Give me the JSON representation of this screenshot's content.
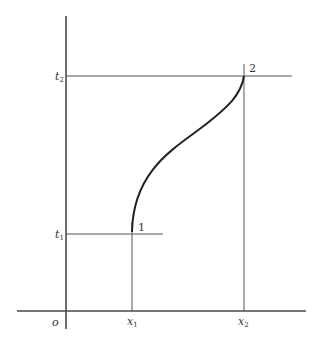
{
  "diagram": {
    "type": "worldline-spacetime-diagram",
    "colors": {
      "axis": "#4a4a4a",
      "guide": "#555555",
      "curve": "#222222",
      "text": "#333333"
    },
    "labels": {
      "origin": "o",
      "t1": "t",
      "t1_sub": "1",
      "t2": "t",
      "t2_sub": "2",
      "x1": "x",
      "x1_sub": "1",
      "x2": "x",
      "x2_sub": "2",
      "point1": "1",
      "point2": "2"
    },
    "points": {
      "point1": {
        "x": "x1",
        "t": "t1"
      },
      "point2": {
        "x": "x2",
        "t": "t2"
      }
    }
  }
}
